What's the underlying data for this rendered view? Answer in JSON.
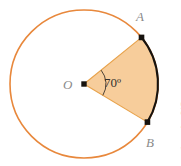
{
  "figure": {
    "type": "geometry-diagram",
    "labels": {
      "point_a": "A",
      "point_b": "B",
      "center": "O",
      "angle": "70º"
    },
    "credit": "Ilustrações: DAE",
    "colors": {
      "circle_stroke": "#e8883c",
      "sector_fill": "#f7cd9b",
      "sector_edge": "#e8a24a",
      "arc_stroke": "#17130f",
      "point_dot": "#17130f",
      "label_grey": "#8a8a8a",
      "angle_text": "#33322f",
      "credit_text": "#9b9b9b",
      "background": "#ffffff"
    },
    "geometry": {
      "center_x": 84,
      "center_y": 84,
      "radius": 74,
      "angle_degrees": 70,
      "start_angle_degrees": -39,
      "end_angle_degrees": 31,
      "point_a_x": 143,
      "point_a_y": 36,
      "point_b_x": 143,
      "point_b_y": 126,
      "angle_marker_radius": 22
    }
  }
}
